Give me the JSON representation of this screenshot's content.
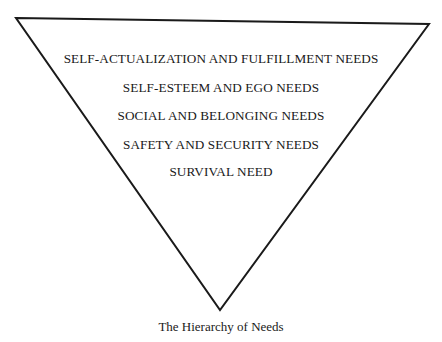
{
  "diagram": {
    "type": "inverted-triangle",
    "stroke_color": "#1a1a1a",
    "levels": [
      {
        "label": "SELF-ACTUALIZATION AND FULFILLMENT NEEDS"
      },
      {
        "label": "SELF-ESTEEM AND EGO NEEDS"
      },
      {
        "label": "SOCIAL AND BELONGING NEEDS"
      },
      {
        "label": "SAFETY AND SECURITY NEEDS"
      },
      {
        "label": "SURVIVAL NEED"
      }
    ],
    "caption": "The Hierarchy of Needs"
  }
}
